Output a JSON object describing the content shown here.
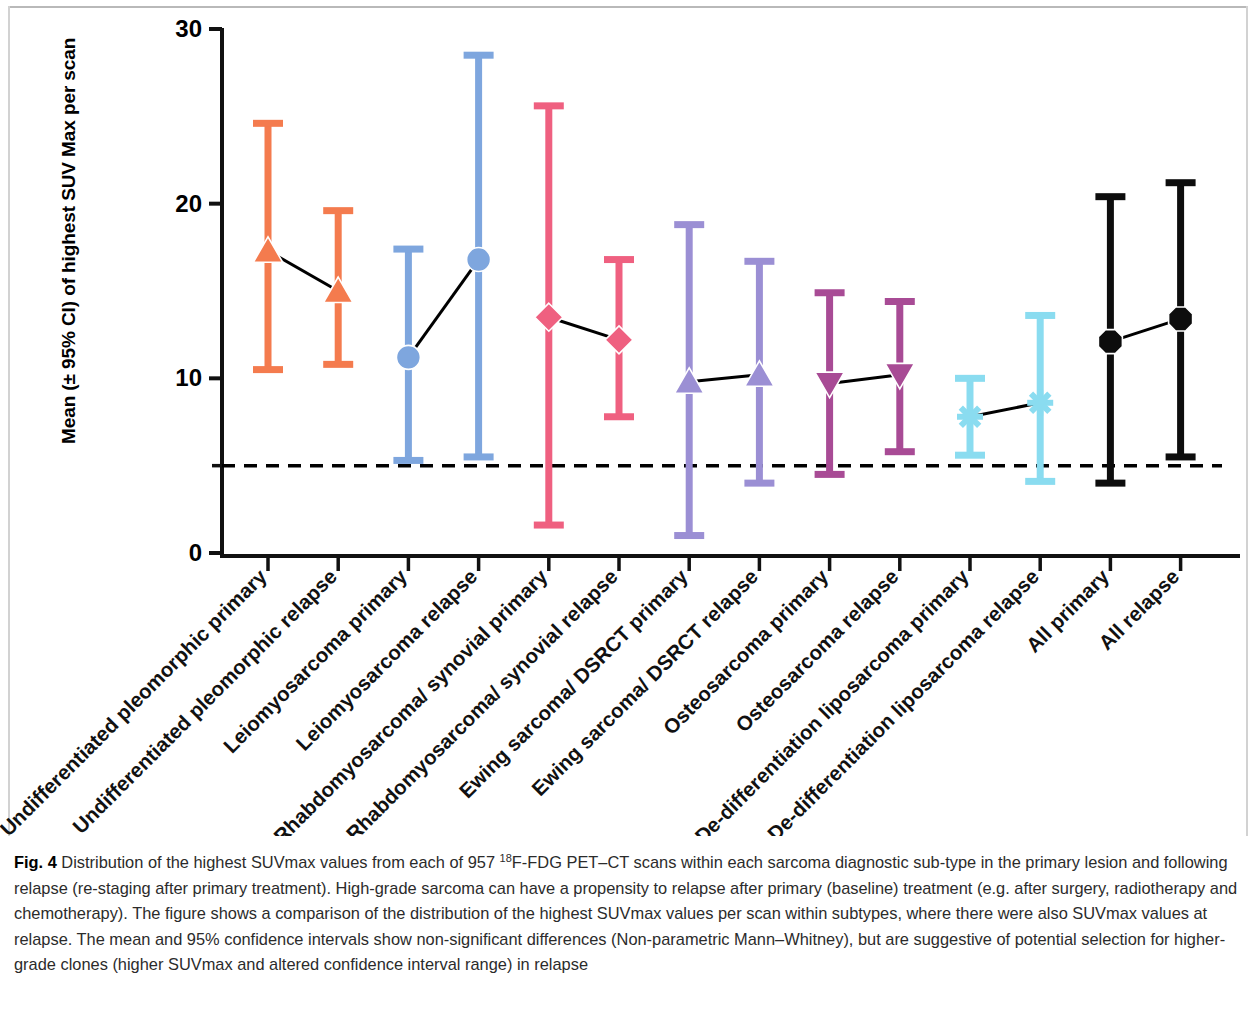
{
  "figure": {
    "label": "Fig. 4",
    "caption_part_1": " Distribution of the highest SUVmax values from each of 957 ",
    "caption_sup": "18",
    "caption_part_2": "F-FDG PET–CT scans within each sarcoma diagnostic sub-type in the primary lesion and following relapse (re-staging after primary treatment). High-grade sarcoma can have a propensity to relapse after primary (baseline) treatment (e.g. after surgery, radiotherapy and chemotherapy). The figure shows a comparison of the distribution of the highest SUVmax values per scan within subtypes, where there were also SUVmax values at relapse. The mean and 95% confidence intervals show non-significant differences (Non-parametric Mann–Whitney), but are suggestive of potential selection for higher-grade clones (higher SUVmax and altered confidence interval range) in relapse"
  },
  "chart_data": {
    "type": "scatter",
    "title": "",
    "xlabel": "",
    "ylabel": "Mean (± 95% CI) of highest SUV Max per scan",
    "ylim": [
      0,
      30
    ],
    "yticks": [
      0,
      10,
      20,
      30
    ],
    "yticklabels": [
      "0",
      "10",
      "20",
      "30"
    ],
    "grid": false,
    "legend_position": "none",
    "reference_line": {
      "value": 5,
      "style": "dashed",
      "color": "#000000",
      "label": ""
    },
    "categories": [
      "Undifferentiated pleomorphic primary",
      "Undifferentiated pleomorphic relapse",
      "Leiomyosarcoma primary",
      "Leiomyosarcoma relapse",
      "Rhabdomyosarcoma/ synovial primary",
      "Rhabdomyosarcoma/ synovial relapse",
      "Ewing sarcoma/ DSRCT primary",
      "Ewing sarcoma/ DSRCT relapse",
      "Osteosarcoma primary",
      "Osteosarcoma relapse",
      "De-differentiation liposarcoma primary",
      "De-differentiation liposarcoma relapse",
      "All primary",
      "All relapse"
    ],
    "values": [
      17.3,
      15.0,
      11.2,
      16.8,
      13.5,
      12.2,
      9.8,
      10.2,
      9.7,
      10.2,
      7.8,
      8.6,
      12.1,
      13.4
    ],
    "ci_upper": [
      24.6,
      19.6,
      17.4,
      28.5,
      25.6,
      16.8,
      18.8,
      16.7,
      14.9,
      14.4,
      10.0,
      13.6,
      20.4,
      21.2
    ],
    "ci_lower": [
      10.5,
      10.8,
      5.3,
      5.5,
      1.6,
      7.8,
      1.0,
      4.0,
      4.5,
      5.8,
      5.6,
      4.1,
      4.0,
      5.5
    ],
    "series": [
      {
        "name": "Undifferentiated pleomorphic",
        "color": "#F47B4E",
        "marker": "triangle-up",
        "points": [
          {
            "category": "Undifferentiated pleomorphic primary",
            "mean": 17.3,
            "ci_low": 10.5,
            "ci_high": 24.6
          },
          {
            "category": "Undifferentiated pleomorphic relapse",
            "mean": 15.0,
            "ci_low": 10.8,
            "ci_high": 19.6
          }
        ]
      },
      {
        "name": "Leiomyosarcoma",
        "color": "#7EA6DE",
        "marker": "circle",
        "points": [
          {
            "category": "Leiomyosarcoma primary",
            "mean": 11.2,
            "ci_low": 5.3,
            "ci_high": 17.4
          },
          {
            "category": "Leiomyosarcoma relapse",
            "mean": 16.8,
            "ci_low": 5.5,
            "ci_high": 28.5
          }
        ]
      },
      {
        "name": "Rhabdomyosarcoma/ synovial",
        "color": "#EF6080",
        "marker": "diamond",
        "points": [
          {
            "category": "Rhabdomyosarcoma/ synovial primary",
            "mean": 13.5,
            "ci_low": 1.6,
            "ci_high": 25.6
          },
          {
            "category": "Rhabdomyosarcoma/ synovial relapse",
            "mean": 12.2,
            "ci_low": 7.8,
            "ci_high": 16.8
          }
        ]
      },
      {
        "name": "Ewing sarcoma/ DSRCT",
        "color": "#9B8FD4",
        "marker": "triangle-up",
        "points": [
          {
            "category": "Ewing sarcoma/ DSRCT primary",
            "mean": 9.8,
            "ci_low": 1.0,
            "ci_high": 18.8
          },
          {
            "category": "Ewing sarcoma/ DSRCT relapse",
            "mean": 10.2,
            "ci_low": 4.0,
            "ci_high": 16.7
          }
        ]
      },
      {
        "name": "Osteosarcoma",
        "color": "#A84B95",
        "marker": "triangle-down",
        "points": [
          {
            "category": "Osteosarcoma primary",
            "mean": 9.7,
            "ci_low": 4.5,
            "ci_high": 14.9
          },
          {
            "category": "Osteosarcoma relapse",
            "mean": 10.2,
            "ci_low": 5.8,
            "ci_high": 14.4
          }
        ]
      },
      {
        "name": "De-differentiation liposarcoma",
        "color": "#8ADCF0",
        "marker": "asterisk",
        "points": [
          {
            "category": "De-differentiation liposarcoma primary",
            "mean": 7.8,
            "ci_low": 5.6,
            "ci_high": 10.0
          },
          {
            "category": "De-differentiation liposarcoma relapse",
            "mean": 8.6,
            "ci_low": 4.1,
            "ci_high": 13.6
          }
        ]
      },
      {
        "name": "All",
        "color": "#0D0D0D",
        "marker": "octagon",
        "points": [
          {
            "category": "All primary",
            "mean": 12.1,
            "ci_low": 4.0,
            "ci_high": 20.4
          },
          {
            "category": "All relapse",
            "mean": 13.4,
            "ci_low": 5.5,
            "ci_high": 21.2
          }
        ]
      }
    ],
    "connectors": [
      {
        "from": "Undifferentiated pleomorphic primary",
        "to": "Undifferentiated pleomorphic relapse"
      },
      {
        "from": "Leiomyosarcoma primary",
        "to": "Leiomyosarcoma relapse"
      },
      {
        "from": "Rhabdomyosarcoma/ synovial primary",
        "to": "Rhabdomyosarcoma/ synovial relapse"
      },
      {
        "from": "Ewing sarcoma/ DSRCT primary",
        "to": "Ewing sarcoma/ DSRCT relapse"
      },
      {
        "from": "Osteosarcoma primary",
        "to": "Osteosarcoma relapse"
      },
      {
        "from": "De-differentiation liposarcoma primary",
        "to": "De-differentiation liposarcoma relapse"
      },
      {
        "from": "All primary",
        "to": "All relapse"
      }
    ]
  }
}
